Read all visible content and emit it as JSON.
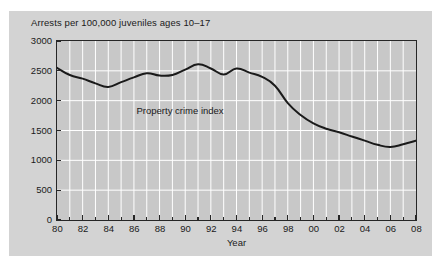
{
  "figure": {
    "caption": "Arrests per 100,000 juveniles ages 10–17",
    "series_annotation": "Property crime index",
    "xaxis_title": "Year",
    "colors": {
      "page_background": "#ffffff",
      "card_background": "#d3d3d3",
      "plot_background": "#c8c8c8",
      "gridline": "#ffffff",
      "axis": "#262626",
      "line": "#1a1a1a",
      "text": "#1a1a1a"
    }
  },
  "chart_data": {
    "type": "line",
    "title": "Arrests per 100,000 juveniles ages 10–17",
    "xlabel": "Year",
    "ylabel": "Arrests per 100,000 juveniles ages 10–17",
    "xlim": [
      1980,
      2008
    ],
    "ylim": [
      0,
      3000
    ],
    "ytick_values": [
      0,
      500,
      1000,
      1500,
      2000,
      2500,
      3000
    ],
    "ytick_labels": [
      "0",
      "500",
      "1000",
      "1500",
      "2000",
      "2500",
      "3000"
    ],
    "xtick_values": [
      1980,
      1982,
      1984,
      1986,
      1988,
      1990,
      1992,
      1994,
      1996,
      1998,
      2000,
      2002,
      2004,
      2006,
      2008
    ],
    "xtick_labels": [
      "80",
      "82",
      "84",
      "86",
      "88",
      "90",
      "92",
      "94",
      "96",
      "98",
      "00",
      "02",
      "04",
      "06",
      "08"
    ],
    "grid": "vertical-and-horizontal-white",
    "legend": "inline-annotation",
    "annotations": [
      {
        "text": "Property crime index",
        "x": 1986.2,
        "y": 1820
      }
    ],
    "series": [
      {
        "name": "Property crime index",
        "x": [
          1980,
          1981,
          1982,
          1983,
          1984,
          1985,
          1986,
          1987,
          1988,
          1989,
          1990,
          1991,
          1992,
          1993,
          1994,
          1995,
          1996,
          1997,
          1998,
          1999,
          2000,
          2001,
          2002,
          2003,
          2004,
          2005,
          2006,
          2007,
          2008
        ],
        "values": [
          2550,
          2430,
          2370,
          2290,
          2230,
          2310,
          2390,
          2460,
          2420,
          2430,
          2520,
          2610,
          2540,
          2440,
          2540,
          2470,
          2400,
          2250,
          1960,
          1760,
          1620,
          1530,
          1470,
          1400,
          1330,
          1260,
          1225,
          1270,
          1330
        ]
      }
    ]
  }
}
